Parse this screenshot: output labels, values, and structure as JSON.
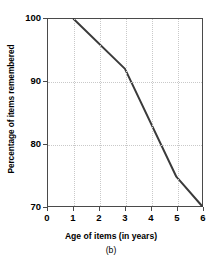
{
  "chart_data": {
    "type": "line",
    "title": "",
    "caption": "(b)",
    "xlabel": "Age of items (in years)",
    "ylabel": "Percentage of items remembered",
    "xlim": [
      0,
      6
    ],
    "ylim": [
      70,
      100
    ],
    "xticks": [
      0,
      1,
      2,
      3,
      4,
      5,
      6
    ],
    "xticklabels": [
      "0",
      "1",
      "2",
      "3",
      "4",
      "5",
      "6"
    ],
    "yticks": [
      70,
      80,
      90,
      100
    ],
    "yticklabels": [
      "70",
      "80",
      "90",
      "100"
    ],
    "grid": {
      "vertical_at": [
        1,
        2,
        3,
        4,
        5
      ],
      "horizontal_at": [
        80,
        90
      ],
      "style": "dotted",
      "color": "#c9c9c9"
    },
    "legend": null,
    "series": [
      {
        "name": "Percentage of items remembered",
        "color": "#3a3a3a",
        "line_width": 2,
        "x": [
          1,
          3,
          5,
          6
        ],
        "values": [
          100,
          92,
          74.7,
          70
        ]
      }
    ],
    "annotations": []
  },
  "axes": {
    "frame_color": "#4a4a4a",
    "background": "#ffffff"
  }
}
